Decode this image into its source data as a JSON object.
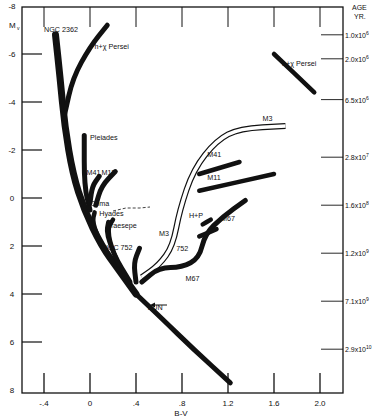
{
  "chart_data": {
    "type": "line",
    "title": "",
    "xlabel": "B-V",
    "ylabel": "Mv",
    "right_axis_label": [
      "AGE",
      "YR."
    ],
    "xlim": [
      -0.6,
      2.2
    ],
    "ylim": [
      8,
      -8
    ],
    "x_ticks": [
      {
        "value": -0.4,
        "label": "-.4"
      },
      {
        "value": 0,
        "label": "0"
      },
      {
        "value": 0.4,
        "label": ".4"
      },
      {
        "value": 0.8,
        "label": ".8"
      },
      {
        "value": 1.2,
        "label": "1.2"
      },
      {
        "value": 1.6,
        "label": "1.6"
      },
      {
        "value": 2.0,
        "label": "2.0"
      }
    ],
    "y_ticks": [
      {
        "value": -8,
        "label": "-8"
      },
      {
        "value": -6,
        "label": "-6"
      },
      {
        "value": -4,
        "label": "-4"
      },
      {
        "value": -2,
        "label": "-2"
      },
      {
        "value": 0,
        "label": "0"
      },
      {
        "value": 2,
        "label": "2"
      },
      {
        "value": 4,
        "label": "4"
      },
      {
        "value": 6,
        "label": "6"
      },
      {
        "value": 8,
        "label": "8"
      }
    ],
    "right_ticks": [
      {
        "mv": -6.8,
        "base": "1.0x10",
        "exp": "6"
      },
      {
        "mv": -5.8,
        "base": "2.0x10",
        "exp": "6"
      },
      {
        "mv": -4.1,
        "base": "6.5x10",
        "exp": "6"
      },
      {
        "mv": -1.7,
        "base": "2.8x10",
        "exp": "7"
      },
      {
        "mv": 0.3,
        "base": "1.6x10",
        "exp": "8"
      },
      {
        "mv": 2.3,
        "base": "1.2x10",
        "exp": "9"
      },
      {
        "mv": 4.3,
        "base": "7.1x10",
        "exp": "9"
      },
      {
        "mv": 6.3,
        "base": "2.9x10",
        "exp": "10"
      }
    ],
    "series": [
      {
        "name": "NGC 2362",
        "style": "thick",
        "points": [
          [
            -0.3,
            -6.8
          ],
          [
            -0.26,
            -5
          ],
          [
            -0.22,
            -3
          ],
          [
            -0.15,
            -1
          ],
          [
            -0.05,
            0.5
          ],
          [
            0.1,
            2
          ],
          [
            0.25,
            3
          ],
          [
            0.4,
            4
          ]
        ]
      },
      {
        "name": "h+χ Persei",
        "style": "thick",
        "points": [
          [
            0.15,
            -7.2
          ],
          [
            0.0,
            -6.3
          ],
          [
            -0.15,
            -5
          ],
          [
            -0.22,
            -3.5
          ]
        ]
      },
      {
        "name": "Pleiades",
        "style": "thick",
        "points": [
          [
            -0.05,
            -2.6
          ],
          [
            -0.05,
            -0.5
          ],
          [
            0,
            0.5
          ]
        ]
      },
      {
        "name": "M41",
        "style": "thick",
        "points": [
          [
            0.08,
            -0.9
          ],
          [
            0.02,
            -0.5
          ],
          [
            0,
            0.2
          ]
        ]
      },
      {
        "name": "M11",
        "style": "thick",
        "points": [
          [
            0.22,
            -1.1
          ],
          [
            0.1,
            -0.5
          ],
          [
            0.05,
            0.3
          ]
        ]
      },
      {
        "name": "Coma",
        "style": "thick",
        "points": [
          [
            0.04,
            0.6
          ],
          [
            0.02,
            1
          ],
          [
            0.1,
            2
          ],
          [
            0.3,
            3.3
          ]
        ]
      },
      {
        "name": "Hyades",
        "style": "thick",
        "points": [
          [
            0.2,
            0.9
          ],
          [
            0.15,
            1.3
          ],
          [
            0.2,
            2.3
          ],
          [
            0.35,
            3.5
          ]
        ]
      },
      {
        "name": "Praesepe",
        "style": "thick",
        "points": [
          [
            0.16,
            1
          ],
          [
            0.14,
            1.5
          ],
          [
            0.25,
            2.8
          ]
        ]
      },
      {
        "name": "NGC 752",
        "style": "thick",
        "points": [
          [
            0.43,
            2.1
          ],
          [
            0.38,
            2.7
          ],
          [
            0.4,
            3.5
          ]
        ]
      },
      {
        "name": "M3",
        "style": "outline",
        "points": [
          [
            0.45,
            3.3
          ],
          [
            0.6,
            2.8
          ],
          [
            0.72,
            2
          ],
          [
            0.78,
            0.5
          ],
          [
            0.9,
            -1.2
          ],
          [
            1.1,
            -2.4
          ],
          [
            1.3,
            -2.9
          ],
          [
            1.7,
            -3
          ]
        ]
      },
      {
        "name": "M67",
        "style": "thick",
        "points": [
          [
            0.45,
            3.5
          ],
          [
            0.6,
            2.9
          ],
          [
            0.8,
            2.9
          ],
          [
            0.95,
            2.5
          ],
          [
            1.0,
            1.5
          ],
          [
            1.15,
            0.8
          ],
          [
            1.35,
            0.1
          ]
        ]
      },
      {
        "name": "M41 giants",
        "style": "thick",
        "points": [
          [
            0.95,
            -1
          ],
          [
            1.3,
            -1.5
          ]
        ]
      },
      {
        "name": "M11 giants",
        "style": "thick",
        "points": [
          [
            0.95,
            -0.3
          ],
          [
            1.6,
            -1
          ]
        ]
      },
      {
        "name": "H+P giants",
        "style": "thick",
        "points": [
          [
            0.98,
            1.1
          ],
          [
            1.05,
            0.9
          ]
        ]
      },
      {
        "name": "752 giants",
        "style": "thick",
        "points": [
          [
            0.95,
            1.6
          ],
          [
            1.1,
            1.3
          ]
        ]
      },
      {
        "name": "Lower main sequence",
        "style": "thick",
        "points": [
          [
            0.4,
            4
          ],
          [
            0.62,
            5
          ],
          [
            0.9,
            6.3
          ],
          [
            1.22,
            7.7
          ]
        ]
      },
      {
        "name": "h+χ Persei (red supergiants)",
        "style": "thick",
        "points": [
          [
            1.6,
            -6
          ],
          [
            1.95,
            -4.4
          ]
        ]
      }
    ],
    "annotations": [
      {
        "text": "NGC 2362",
        "x": -0.4,
        "y": -6.9
      },
      {
        "text": "h+χ Persei",
        "x": 0.04,
        "y": -6.2
      },
      {
        "text": "h+χ Persei",
        "x": 1.67,
        "y": -5.5
      },
      {
        "text": "Pleiades",
        "x": 0.0,
        "y": -2.4
      },
      {
        "text": "M41",
        "x": -0.03,
        "y": -0.95
      },
      {
        "text": "M11",
        "x": 0.1,
        "y": -0.95
      },
      {
        "text": "Coma",
        "x": 0.0,
        "y": 0.35
      },
      {
        "text": "Hyades",
        "x": 0.08,
        "y": 0.75
      },
      {
        "text": "Praesepe",
        "x": 0.14,
        "y": 1.25
      },
      {
        "text": "NGC 752",
        "x": 0.11,
        "y": 2.15
      },
      {
        "text": "M3",
        "x": 1.5,
        "y": -3.2
      },
      {
        "text": "M3",
        "x": 0.6,
        "y": 1.6
      },
      {
        "text": "M41",
        "x": 1.02,
        "y": -1.7
      },
      {
        "text": "M11",
        "x": 1.02,
        "y": -0.75
      },
      {
        "text": "H+P",
        "x": 0.86,
        "y": 0.85
      },
      {
        "text": "752",
        "x": 0.75,
        "y": 2.2
      },
      {
        "text": "M67",
        "x": 1.14,
        "y": 0.95
      },
      {
        "text": "M67",
        "x": 0.83,
        "y": 3.45
      },
      {
        "text": "SUN",
        "x": 0.5,
        "y": 4.65
      }
    ],
    "grid": false,
    "legend": "none"
  }
}
